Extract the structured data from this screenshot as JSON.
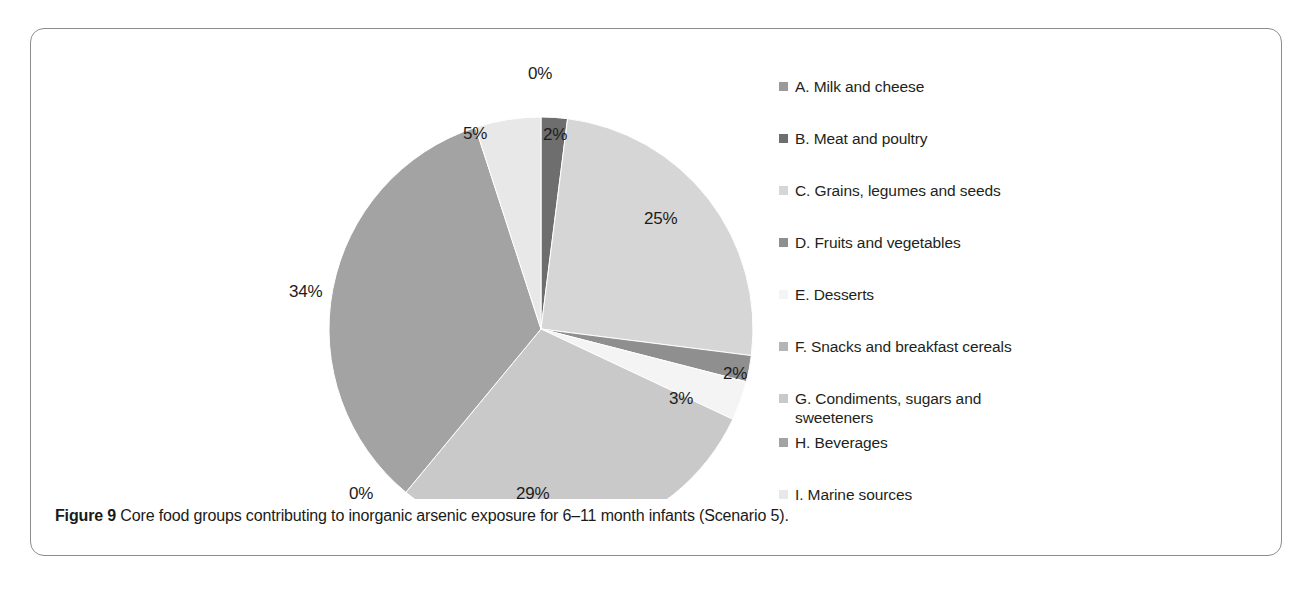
{
  "caption": {
    "prefix": "Figure 9",
    "text": " Core food groups contributing to inorganic arsenic exposure for 6–11 month infants (Scenario 5)."
  },
  "legend": {
    "items": [
      {
        "key": "A",
        "label": "A. Milk and cheese",
        "color": "#9a9a9a"
      },
      {
        "key": "B",
        "label": "B. Meat and poultry",
        "color": "#6e6e6e"
      },
      {
        "key": "C",
        "label": "C. Grains, legumes and seeds",
        "color": "#d6d6d6"
      },
      {
        "key": "D",
        "label": "D. Fruits and vegetables",
        "color": "#8f8f8f"
      },
      {
        "key": "E",
        "label": "E. Desserts",
        "color": "#f4f4f4"
      },
      {
        "key": "F",
        "label": "F. Snacks and breakfast cereals",
        "color": "#b5b5b5"
      },
      {
        "key": "G",
        "label": "G. Condiments, sugars and\nsweeteners",
        "color": "#c9c9c9"
      },
      {
        "key": "H",
        "label": "H. Beverages",
        "color": "#a3a3a3"
      },
      {
        "key": "I",
        "label": "I. Marine sources",
        "color": "#e8e8e8"
      }
    ]
  },
  "chart_data": {
    "type": "pie",
    "unit": "percent",
    "legend_position": "right",
    "start_angle_deg": 0,
    "direction": "clockwise",
    "categories": [
      "A. Milk and cheese",
      "B. Meat and poultry",
      "C. Grains, legumes and seeds",
      "D. Fruits and vegetables",
      "E. Desserts",
      "F. Snacks and breakfast cereals",
      "G. Condiments, sugars and sweeteners",
      "H. Beverages",
      "I. Marine sources"
    ],
    "values": [
      0,
      2,
      25,
      2,
      3,
      0,
      29,
      34,
      5
    ],
    "labels": [
      "0%",
      "2%",
      "25%",
      "2%",
      "3%",
      "0%",
      "29%",
      "34%",
      "5%"
    ],
    "colors": [
      "#9a9a9a",
      "#6e6e6e",
      "#d6d6d6",
      "#8f8f8f",
      "#f4f4f4",
      "#b5b5b5",
      "#c9c9c9",
      "#a3a3a3",
      "#e8e8e8"
    ],
    "data_labels": [
      {
        "text": "0%",
        "x": 497,
        "y": 35,
        "inside": false
      },
      {
        "text": "2%",
        "x": 512,
        "y": 96,
        "inside": true
      },
      {
        "text": "25%",
        "x": 613,
        "y": 180,
        "inside": true
      },
      {
        "text": "2%",
        "x": 692,
        "y": 335,
        "inside": false
      },
      {
        "text": "3%",
        "x": 638,
        "y": 360,
        "inside": false
      },
      {
        "text": "29%",
        "x": 485,
        "y": 455,
        "inside": true
      },
      {
        "text": "0%",
        "x": 318,
        "y": 455,
        "inside": false
      },
      {
        "text": "34%",
        "x": 258,
        "y": 253,
        "inside": true
      },
      {
        "text": "5%",
        "x": 432,
        "y": 95,
        "inside": true
      }
    ]
  }
}
